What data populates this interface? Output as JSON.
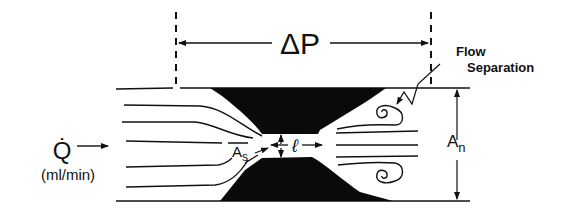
{
  "diagram": {
    "pressure_drop_label": "ΔP",
    "flow_rate_symbol": "Q̇",
    "flow_rate_units": "(ml/min)",
    "stenosis_area_label": "A",
    "stenosis_area_subscript": "s",
    "length_label": "ℓ",
    "normal_area_label": "A",
    "normal_area_subscript": "n",
    "flow_separation_label_line1": "Flow",
    "flow_separation_label_line2": "Separation"
  },
  "colors": {
    "ink": "#111111",
    "background": "#ffffff"
  }
}
